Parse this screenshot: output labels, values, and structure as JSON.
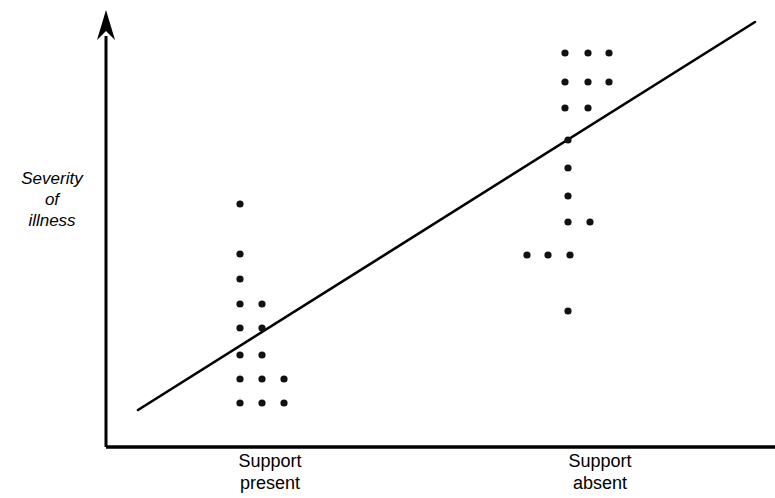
{
  "chart_data": {
    "type": "scatter",
    "title": "",
    "subtitle": "",
    "xlabel": "",
    "ylabel": "Severity\nof\nillness",
    "ylabel_lines": [
      "Severity",
      "of",
      "illness"
    ],
    "categories": [
      "Support\npresent",
      "Support\nabsent"
    ],
    "category_labels": [
      {
        "line1": "Support",
        "line2": "present"
      },
      {
        "line1": "Support",
        "line2": "absent"
      }
    ],
    "grid": false,
    "legend": null,
    "axes": {
      "x_axis_arrow": false,
      "y_axis_arrow": true,
      "x_tick_labels_shown": true,
      "y_tick_labels_shown": false,
      "origin": [
        106,
        447
      ],
      "x_axis_end": [
        775,
        447
      ],
      "y_axis_top": [
        106,
        10
      ]
    },
    "annotations": [
      {
        "kind": "trend-line",
        "label": "regression line",
        "from": [
          138,
          410
        ],
        "to": [
          755,
          22
        ]
      }
    ],
    "colors": {
      "point": "#111111",
      "line": "#000000",
      "axis": "#000000",
      "background": "#ffffff"
    },
    "series": [
      {
        "name": "Support present",
        "n": 12,
        "points": [
          [
            240,
            204
          ],
          [
            240,
            254
          ],
          [
            240,
            279
          ],
          [
            240,
            304
          ],
          [
            262,
            304
          ],
          [
            240,
            328
          ],
          [
            262,
            328
          ],
          [
            240,
            355
          ],
          [
            262,
            355
          ],
          [
            240,
            379
          ],
          [
            262,
            379
          ],
          [
            284,
            379
          ],
          [
            240,
            403
          ],
          [
            262,
            403
          ],
          [
            284,
            403
          ]
        ]
      },
      {
        "name": "Support absent",
        "n": 15,
        "points": [
          [
            565,
            53
          ],
          [
            588,
            53
          ],
          [
            609,
            53
          ],
          [
            565,
            82
          ],
          [
            588,
            82
          ],
          [
            609,
            82
          ],
          [
            565,
            108
          ],
          [
            588,
            108
          ],
          [
            568,
            140
          ],
          [
            568,
            168
          ],
          [
            568,
            196
          ],
          [
            568,
            222
          ],
          [
            590,
            222
          ],
          [
            527,
            255
          ],
          [
            548,
            255
          ],
          [
            570,
            255
          ],
          [
            568,
            311
          ]
        ]
      }
    ]
  }
}
